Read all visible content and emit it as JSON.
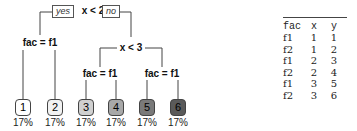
{
  "tree": {
    "root": {
      "label": "x < 2",
      "yes_label": "yes",
      "no_label": "no"
    },
    "left_split": {
      "label": "fac = f1"
    },
    "right_split": {
      "label": "x < 3"
    },
    "right_left_split": {
      "label": "fac = f1"
    },
    "right_right_split": {
      "label": "fac = f1"
    },
    "leaves": [
      {
        "id": "1",
        "pct": "17%",
        "fill": "#ffffff",
        "text": "#111111"
      },
      {
        "id": "2",
        "pct": "17%",
        "fill": "#f2f2f2",
        "text": "#111111"
      },
      {
        "id": "3",
        "pct": "17%",
        "fill": "#d0d0d0",
        "text": "#222222"
      },
      {
        "id": "4",
        "pct": "17%",
        "fill": "#a8a8a8",
        "text": "#222222"
      },
      {
        "id": "5",
        "pct": "17%",
        "fill": "#7a7a7a",
        "text": "#222222"
      },
      {
        "id": "6",
        "pct": "17%",
        "fill": "#5a5a5a",
        "text": "#222222"
      }
    ]
  },
  "table": {
    "headers": [
      "fac",
      "x",
      "y"
    ],
    "rows": [
      [
        "f1",
        "1",
        "1"
      ],
      [
        "f2",
        "1",
        "2"
      ],
      [
        "f1",
        "2",
        "3"
      ],
      [
        "f2",
        "2",
        "4"
      ],
      [
        "f1",
        "3",
        "5"
      ],
      [
        "f2",
        "3",
        "6"
      ]
    ]
  }
}
